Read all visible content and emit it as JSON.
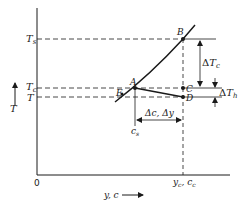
{
  "diagram": {
    "axes": {
      "y_label": "T",
      "x_label": "y, c",
      "origin": "0"
    },
    "y_levels": {
      "Ts": {
        "main": "T",
        "sub": "s"
      },
      "Tc": {
        "main": "T",
        "sub": "c"
      },
      "T": {
        "main": "T"
      }
    },
    "points": {
      "A": "A",
      "B": "B",
      "C": "C",
      "D": "D",
      "E": "E"
    },
    "dimensions": {
      "delta_Tc": {
        "delta": "Δ",
        "main": "T",
        "sub": "c"
      },
      "delta_Th": {
        "delta": "Δ",
        "main": "T",
        "sub": "h"
      },
      "delta_c_y": "Δc, Δy"
    },
    "x_marks": {
      "cs": {
        "main": "c",
        "sub": "s"
      },
      "yc_cc": {
        "y": "y",
        "y_sub": "c",
        "sep": ", ",
        "c": "c",
        "c_sub": "c"
      }
    },
    "colors": {
      "ink": "#1a1a1a",
      "background": "#ffffff"
    }
  }
}
